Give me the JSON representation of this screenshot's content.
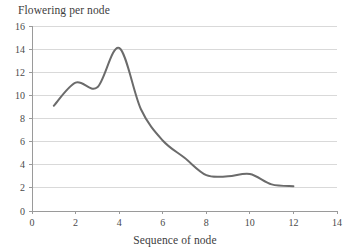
{
  "chart_data": {
    "type": "line",
    "title": "Flowering per node",
    "subtitle": "",
    "xlabel": "Sequence of node",
    "ylabel": "",
    "xlim": [
      0,
      14
    ],
    "ylim": [
      0,
      16
    ],
    "xticks": [
      0,
      2,
      4,
      6,
      8,
      10,
      12,
      14
    ],
    "yticks": [
      0,
      2,
      4,
      6,
      8,
      10,
      12,
      14,
      16
    ],
    "xtick_labels": [
      "0",
      "2",
      "4",
      "6",
      "8",
      "10",
      "12",
      "14"
    ],
    "ytick_labels": [
      "0",
      "2",
      "4",
      "6",
      "8",
      "10",
      "12",
      "14",
      "16"
    ],
    "grid": {
      "horizontal": true,
      "vertical": false,
      "color": "#d9d9d9"
    },
    "legend": {
      "visible": false,
      "position": "none"
    },
    "smoothing": "spline",
    "series": [
      {
        "name": "Flowering per node",
        "color": "#6b6b6b",
        "line_width": 2,
        "markers": false,
        "x": [
          1,
          2,
          3,
          4,
          5,
          6,
          7,
          8,
          9,
          10,
          11,
          12
        ],
        "values": [
          9.1,
          11.1,
          10.7,
          14.1,
          8.8,
          6.1,
          4.6,
          3.1,
          3.0,
          3.2,
          2.3,
          2.15
        ]
      }
    ],
    "annotations": []
  },
  "chart_meta": {
    "title_position": "top-left",
    "xlabel_position": "bottom-center",
    "plot_background": "#ffffff",
    "axis_color": "#9a9a9a"
  }
}
